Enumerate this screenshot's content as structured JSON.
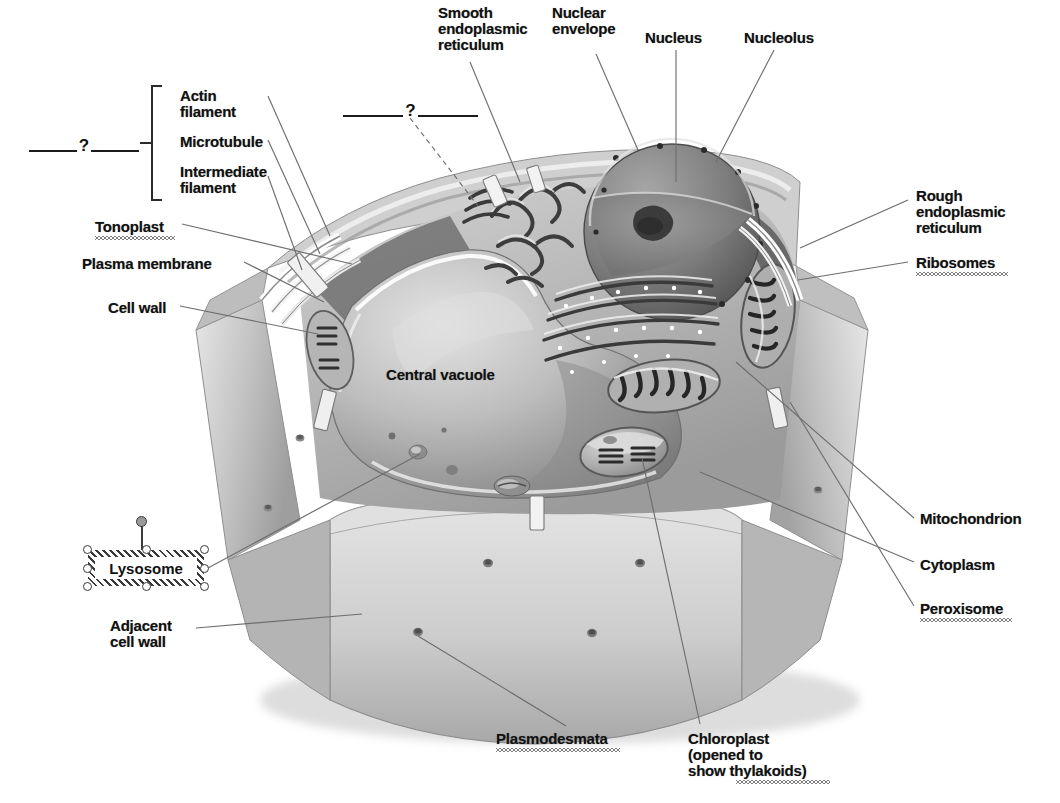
{
  "document": {
    "title": "Plant Cell Structure Diagram",
    "type": "labeled-biology-diagram",
    "subject": "plant cell",
    "rendering": "grayscale airbrush illustration, cut-away view"
  },
  "palette": {
    "background": "#ffffff",
    "label_text": "#111111",
    "leader_line": "#6e6e6e",
    "bracket": "#2b2b2b",
    "blank_line": "#1a1a1a",
    "cell_wall_light": "#c9c9c9",
    "cell_wall_mid": "#aeaeae",
    "cell_wall_dark": "#8c8c8c",
    "cytoplasm": "#bdbdbd",
    "vacuole_light": "#d8d8d8",
    "vacuole_dark": "#7f7f7f",
    "nucleus_fill": "#8e8e8e",
    "nucleus_dark": "#5c5c5c",
    "nucleolus": "#3a3a3a",
    "organelle_dark": "#2f2f2f",
    "selection_handle_fill": "#ffffff",
    "selection_handle_stroke": "#3a3a3a",
    "rotation_handle_fill": "#9a9a9a"
  },
  "blanks": [
    {
      "id": "blank-cytoskeleton",
      "marker": "?",
      "note": "fill-in blank naming the bracketed group (cytoskeleton)",
      "x": 28,
      "y": 140,
      "width": 112
    },
    {
      "id": "blank-golgi",
      "marker": "?",
      "note": "fill-in blank for organelle above the cell (Golgi apparatus)",
      "x": 343,
      "y": 105,
      "width": 135
    }
  ],
  "bracket": {
    "id": "cytoskeleton-bracket",
    "groups": [
      "Actin filament",
      "Microtubule",
      "Intermediate filament"
    ]
  },
  "labels": [
    {
      "id": "actin-filament",
      "text": "Actin\nfilament",
      "x": 180,
      "y": 88,
      "align": "left",
      "squiggle": false
    },
    {
      "id": "microtubule",
      "text": "Microtubule",
      "x": 180,
      "y": 134,
      "align": "left",
      "squiggle": false
    },
    {
      "id": "intermediate-filament",
      "text": "Intermediate\nfilament",
      "x": 180,
      "y": 164,
      "align": "left",
      "squiggle": false
    },
    {
      "id": "tonoplast",
      "text": "Tonoplast",
      "x": 95,
      "y": 219,
      "align": "left",
      "squiggle": true
    },
    {
      "id": "plasma-membrane",
      "text": "Plasma membrane",
      "x": 82,
      "y": 256,
      "align": "left",
      "squiggle": false
    },
    {
      "id": "cell-wall",
      "text": "Cell wall",
      "x": 108,
      "y": 300,
      "align": "left",
      "squiggle": false
    },
    {
      "id": "adjacent-cell-wall",
      "text": "Adjacent\ncell wall",
      "x": 110,
      "y": 618,
      "align": "left",
      "squiggle": false
    },
    {
      "id": "smooth-er",
      "text": "Smooth\nendoplasmic\nreticulum",
      "x": 438,
      "y": 5,
      "align": "left",
      "squiggle": false
    },
    {
      "id": "nuclear-envelope",
      "text": "Nuclear\nenvelope",
      "x": 552,
      "y": 5,
      "align": "left",
      "squiggle": false
    },
    {
      "id": "nucleus",
      "text": "Nucleus",
      "x": 645,
      "y": 30,
      "align": "left",
      "squiggle": false
    },
    {
      "id": "nucleolus",
      "text": "Nucleolus",
      "x": 744,
      "y": 30,
      "align": "left",
      "squiggle": false
    },
    {
      "id": "rough-er",
      "text": "Rough\nendoplasmic\nreticulum",
      "x": 916,
      "y": 188,
      "align": "left",
      "squiggle": false
    },
    {
      "id": "ribosomes",
      "text": "Ribosomes",
      "x": 916,
      "y": 255,
      "align": "left",
      "squiggle": true
    },
    {
      "id": "mitochondrion",
      "text": "Mitochondrion",
      "x": 920,
      "y": 511,
      "align": "left",
      "squiggle": false
    },
    {
      "id": "cytoplasm",
      "text": "Cytoplasm",
      "x": 920,
      "y": 557,
      "align": "left",
      "squiggle": false
    },
    {
      "id": "peroxisome",
      "text": "Peroxisome",
      "x": 920,
      "y": 601,
      "align": "left",
      "squiggle": true
    },
    {
      "id": "central-vacuole",
      "text": "Central vacuole",
      "x": 386,
      "y": 367,
      "align": "left",
      "squiggle": false
    },
    {
      "id": "plasmodesmata",
      "text": "Plasmodesmata",
      "x": 496,
      "y": 731,
      "align": "left",
      "squiggle": true
    },
    {
      "id": "chloroplast",
      "text": "Chloroplast\n(opened to\nshow thylakoids)",
      "x": 688,
      "y": 731,
      "align": "left",
      "squiggle": true
    }
  ],
  "selected_textbox": {
    "id": "lysosome-textbox",
    "text": "Lysosome",
    "state": "selected",
    "x": 88,
    "y": 550,
    "width": 116,
    "height": 36,
    "handles": 8,
    "rotation_handle": true
  },
  "leaders": [
    {
      "from": "actin-filament",
      "to_x": 330,
      "to_y": 235
    },
    {
      "from": "microtubule",
      "to_x": 318,
      "to_y": 252
    },
    {
      "from": "intermediate-filament",
      "to_x": 300,
      "to_y": 268
    },
    {
      "from": "tonoplast",
      "to_x": 352,
      "to_y": 262
    },
    {
      "from": "plasma-membrane",
      "to_x": 322,
      "to_y": 300
    },
    {
      "from": "cell-wall",
      "to_x": 318,
      "to_y": 332
    },
    {
      "from": "smooth-er",
      "to_x": 520,
      "to_y": 180
    },
    {
      "from": "nuclear-envelope",
      "to_x": 637,
      "to_y": 148
    },
    {
      "from": "nucleus",
      "to_x": 678,
      "to_y": 180
    },
    {
      "from": "nucleolus",
      "to_x": 715,
      "to_y": 160
    },
    {
      "from": "rough-er",
      "to_x": 800,
      "to_y": 245
    },
    {
      "from": "ribosomes",
      "to_x": 800,
      "to_y": 278
    },
    {
      "from": "mitochondrion",
      "to_x": 735,
      "to_y": 360
    },
    {
      "from": "cytoplasm",
      "to_x": 700,
      "to_y": 470
    },
    {
      "from": "peroxisome",
      "to_x": 790,
      "to_y": 400
    },
    {
      "from": "plasmodesmata",
      "to_x": 620,
      "to_y": 632
    },
    {
      "from": "chloroplast",
      "to_x": 640,
      "to_y": 455
    },
    {
      "from": "adjacent-cell-wall",
      "to_x": 360,
      "to_y": 612
    },
    {
      "from": "lysosome-textbox",
      "to_x": 420,
      "to_y": 452
    }
  ]
}
